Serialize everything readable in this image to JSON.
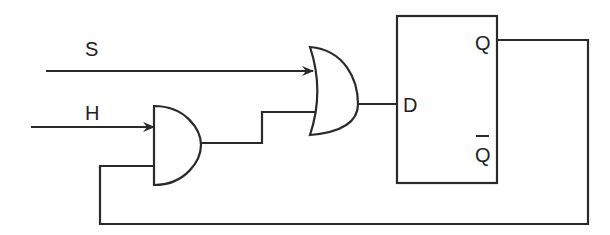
{
  "diagram": {
    "type": "logic-circuit",
    "colors": {
      "stroke": "#2a2a2a",
      "background": "#ffffff",
      "text": "#222222"
    },
    "inputs": [
      {
        "label": "S"
      },
      {
        "label": "H"
      }
    ],
    "gates": [
      {
        "type": "AND",
        "inputs": [
          "H",
          "Q (feedback)"
        ]
      },
      {
        "type": "OR",
        "inputs": [
          "S",
          "AND output"
        ]
      }
    ],
    "flip_flop": {
      "type": "D",
      "input_label": "D",
      "output_label": "Q",
      "inverted_output_label": "Q"
    },
    "feedback": "Q output loops back to second input of AND gate"
  }
}
